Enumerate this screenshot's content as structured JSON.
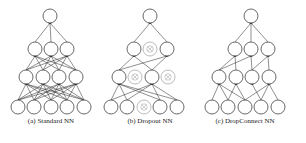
{
  "figure": {
    "node_radius": 7,
    "panels": [
      {
        "id": "standard",
        "caption": "(a) Standard NN",
        "caption_x": 51,
        "layers": [
          [
            {
              "x": 50,
              "y": 16
            }
          ],
          [
            {
              "x": 35,
              "y": 49
            },
            {
              "x": 51,
              "y": 49
            },
            {
              "x": 67,
              "y": 49
            }
          ],
          [
            {
              "x": 26,
              "y": 77
            },
            {
              "x": 43,
              "y": 77
            },
            {
              "x": 59,
              "y": 77
            },
            {
              "x": 76,
              "y": 77
            }
          ],
          [
            {
              "x": 18,
              "y": 107
            },
            {
              "x": 34,
              "y": 107
            },
            {
              "x": 51,
              "y": 107
            },
            {
              "x": 67,
              "y": 107
            },
            {
              "x": 84,
              "y": 107
            }
          ]
        ],
        "edges": "full"
      },
      {
        "id": "dropout",
        "caption": "(b) Dropout NN",
        "caption_x": 150,
        "layers": [
          [
            {
              "x": 150,
              "y": 16
            }
          ],
          [
            {
              "x": 134,
              "y": 49
            },
            {
              "x": 150,
              "y": 49,
              "dropped": true
            },
            {
              "x": 167,
              "y": 49
            }
          ],
          [
            {
              "x": 119,
              "y": 77
            },
            {
              "x": 135,
              "y": 77,
              "dropped": true
            },
            {
              "x": 152,
              "y": 77
            },
            {
              "x": 168,
              "y": 77,
              "dropped": true
            }
          ],
          [
            {
              "x": 111,
              "y": 107
            },
            {
              "x": 127,
              "y": 107
            },
            {
              "x": 144,
              "y": 107,
              "dropped": true
            },
            {
              "x": 160,
              "y": 107
            },
            {
              "x": 177,
              "y": 107
            }
          ]
        ],
        "edges": "full-non-dropped"
      },
      {
        "id": "dropconnect",
        "caption": "(c) DropConnect NN",
        "caption_x": 245,
        "layers": [
          [
            {
              "x": 251,
              "y": 16
            }
          ],
          [
            {
              "x": 235,
              "y": 49
            },
            {
              "x": 251,
              "y": 49
            },
            {
              "x": 268,
              "y": 49
            }
          ],
          [
            {
              "x": 219,
              "y": 77
            },
            {
              "x": 236,
              "y": 77
            },
            {
              "x": 252,
              "y": 77
            },
            {
              "x": 269,
              "y": 77
            }
          ],
          [
            {
              "x": 212,
              "y": 107
            },
            {
              "x": 228,
              "y": 107
            },
            {
              "x": 245,
              "y": 107
            },
            {
              "x": 261,
              "y": 107
            },
            {
              "x": 278,
              "y": 107
            }
          ]
        ],
        "edges": [
          [
            [
              0,
              0
            ],
            [
              0,
              1
            ],
            [
              0,
              2
            ]
          ],
          [
            [
              0,
              0
            ],
            [
              0,
              1
            ],
            [
              1,
              0
            ],
            [
              1,
              2
            ],
            [
              2,
              2
            ],
            [
              2,
              3
            ]
          ],
          [
            [
              0,
              0
            ],
            [
              0,
              1
            ],
            [
              0,
              2
            ],
            [
              1,
              1
            ],
            [
              1,
              2
            ],
            [
              2,
              3
            ],
            [
              3,
              2
            ],
            [
              3,
              3
            ],
            [
              3,
              4
            ]
          ]
        ]
      }
    ]
  }
}
